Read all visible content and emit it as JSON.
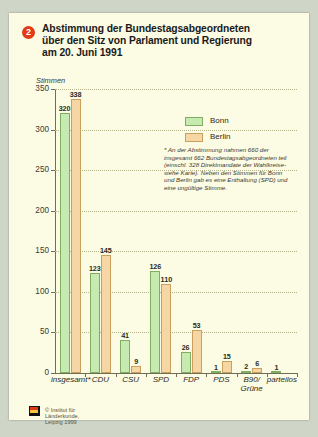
{
  "card": {
    "badge": "2",
    "title_lines": [
      "Abstimmung der Bundestagsabgeordneten",
      "über den Sitz von Parlament und Regierung",
      "am 20. Juni 1991"
    ],
    "ylabel": "Stimmen",
    "source": "© Institut für Länderkunde, Leipzig 1999",
    "footnote": "* An der Abstimmung nahmen 660 der insgesamt 662 Bundestagsabgeordneten teil (einschl. 328 Direktmandate der Wahlkreise- siehe Karte). Neben den Stimmen für Bonn und Berlin gab es eine Enthaltung (SPD) und eine ungültige Stimme."
  },
  "colors": {
    "bonn": "#c7eab0",
    "berlin": "#f6d6a4",
    "badge": "#e03a17",
    "card_bg": "#fcfbe4",
    "page_bg": "#cfd6c8"
  },
  "chart_data": {
    "type": "bar",
    "title": "Abstimmung der Bundestagsabgeordneten über den Sitz von Parlament und Regierung am 20. Juni 1991",
    "xlabel": "",
    "ylabel": "Stimmen",
    "ylim": [
      0,
      350
    ],
    "yticks": [
      0,
      50,
      100,
      150,
      200,
      250,
      300,
      350
    ],
    "grid": true,
    "legend_position": "inside-top-right",
    "categories": [
      "insgesamt*",
      "CDU",
      "CSU",
      "SPD",
      "FDP",
      "PDS",
      "B90/\nGrüne",
      "parteilos"
    ],
    "category_labels": [
      [
        "insgesamt*"
      ],
      [
        "CDU"
      ],
      [
        "CSU"
      ],
      [
        "SPD"
      ],
      [
        "FDP"
      ],
      [
        "PDS"
      ],
      [
        "B90/",
        "Grüne"
      ],
      [
        "parteilos"
      ]
    ],
    "series": [
      {
        "name": "Bonn",
        "values": [
          320,
          123,
          41,
          126,
          26,
          1,
          2,
          1
        ]
      },
      {
        "name": "Berlin",
        "values": [
          338,
          145,
          9,
          110,
          53,
          15,
          6,
          0
        ]
      }
    ]
  }
}
